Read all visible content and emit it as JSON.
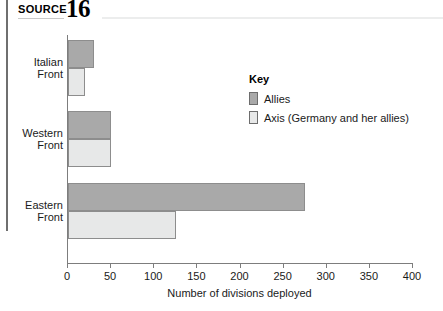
{
  "header": {
    "source_word": "SOURCE",
    "source_number": "16"
  },
  "legend": {
    "title": "Key",
    "items": [
      {
        "label": "Allies",
        "color": "#a9a9a9"
      },
      {
        "label": "Axis (Germany and her allies)",
        "color": "#e7e8e8"
      }
    ]
  },
  "chart_data": {
    "type": "bar",
    "orientation": "horizontal",
    "title": "",
    "subtitle": "",
    "categories": [
      "Italian Front",
      "Western Front",
      "Eastern Front"
    ],
    "series": [
      {
        "name": "Allies",
        "color": "#a9a9a9",
        "values": [
          30,
          50,
          275
        ]
      },
      {
        "name": "Axis (Germany and her allies)",
        "color": "#e7e8e8",
        "values": [
          20,
          50,
          125
        ]
      }
    ],
    "xlabel": "Number of divisions deployed",
    "ylabel": "",
    "xlim": [
      0,
      400
    ],
    "xticks": [
      0,
      50,
      100,
      150,
      200,
      250,
      300,
      350,
      400
    ],
    "xtick_labels": [
      "0",
      "50",
      "100",
      "150",
      "200",
      "250",
      "300",
      "350",
      "400"
    ],
    "grid": false,
    "legend_position": "inside-top-right"
  }
}
